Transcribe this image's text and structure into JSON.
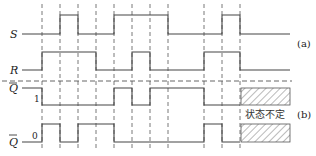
{
  "diagram": {
    "signals": [
      {
        "name": "S",
        "label": "S",
        "overline": false
      },
      {
        "name": "R",
        "label": "R",
        "overline": false
      },
      {
        "name": "Q",
        "label": "Q",
        "overline": true,
        "level_label": "1"
      },
      {
        "name": "Qbar",
        "label": "Q",
        "overline": true,
        "level_label": "0"
      }
    ],
    "part_labels": {
      "a": "(a)",
      "b": "(b)"
    },
    "undefined_state_label": "状态不定",
    "dashed_time_markers_x": [
      42,
      60,
      78,
      96,
      114,
      132,
      150,
      168,
      204,
      222,
      240
    ],
    "waveforms": {
      "S": [
        [
          22,
          0
        ],
        [
          60,
          1
        ],
        [
          78,
          0
        ],
        [
          114,
          1
        ],
        [
          168,
          0
        ],
        [
          222,
          1
        ],
        [
          240,
          0
        ],
        [
          290,
          0
        ]
      ],
      "R": [
        [
          22,
          0
        ],
        [
          42,
          1
        ],
        [
          96,
          0
        ],
        [
          132,
          1
        ],
        [
          150,
          0
        ],
        [
          204,
          1
        ],
        [
          240,
          0
        ],
        [
          290,
          0
        ]
      ],
      "Q": [
        [
          22,
          1
        ],
        [
          42,
          0
        ],
        [
          114,
          1
        ],
        [
          132,
          0
        ],
        [
          150,
          1
        ],
        [
          204,
          0
        ],
        [
          240,
          null
        ]
      ],
      "Qbar": [
        [
          22,
          0
        ],
        [
          42,
          1
        ],
        [
          60,
          0
        ],
        [
          78,
          1
        ],
        [
          114,
          0
        ],
        [
          204,
          1
        ],
        [
          222,
          0
        ],
        [
          240,
          null
        ]
      ]
    },
    "colors": {
      "line": "#444444",
      "text": "#222222",
      "background": "#ffffff"
    }
  }
}
